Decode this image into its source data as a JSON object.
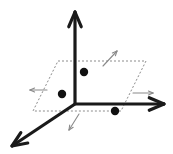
{
  "figure": {
    "type": "diagram",
    "width": 173,
    "height": 154,
    "background_color": "#ffffff"
  },
  "colors": {
    "axis_bold": "#1a1a1a",
    "axis_thin": "#555555",
    "plane_dashed": "#8c8c8c",
    "vector_arrow": "#8a8a8a",
    "point_fill": "#111111"
  },
  "axes": [
    {
      "name": "z-axis",
      "direction": "up",
      "style": "bold-solid-arrow",
      "from": [
        75,
        104
      ],
      "to": [
        75,
        12
      ],
      "stroke_width": 3.2,
      "arrowhead": "open-v"
    },
    {
      "name": "x-axis",
      "direction": "right",
      "style": "bold-solid-arrow",
      "from": [
        75,
        104
      ],
      "to": [
        164,
        104
      ],
      "stroke_width": 3.2,
      "arrowhead": "open-v"
    },
    {
      "name": "y-axis",
      "direction": "down-left",
      "style": "bold-solid-arrow",
      "from": [
        75,
        104
      ],
      "to": [
        12,
        146
      ],
      "stroke_width": 3.2,
      "arrowhead": "open-v"
    }
  ],
  "axis_segments": [
    {
      "name": "z-axis-inner-segment",
      "from": [
        75,
        61
      ],
      "to": [
        75,
        104
      ],
      "stroke_width": 1.6,
      "style": "thin-solid"
    },
    {
      "name": "x-axis-inner-segment",
      "from": [
        75,
        104
      ],
      "to": [
        120,
        104
      ],
      "stroke_width": 1.6,
      "style": "thin-solid"
    },
    {
      "name": "y-axis-inner-segment",
      "from": [
        75,
        104
      ],
      "to": [
        45,
        124
      ],
      "stroke_width": 1.6,
      "style": "thin-solid"
    }
  ],
  "plane": {
    "name": "dashed-parallelogram-plane",
    "style": "dashed",
    "stroke_width": 1.0,
    "dash_pattern": "2,2",
    "corners": [
      [
        58,
        61
      ],
      [
        146,
        61
      ],
      [
        121,
        111
      ],
      [
        33,
        111
      ]
    ]
  },
  "points": [
    {
      "name": "point-upper",
      "cx": 84,
      "cy": 72,
      "r": 4.2
    },
    {
      "name": "point-left",
      "cx": 62,
      "cy": 94,
      "r": 4.2
    },
    {
      "name": "point-lower-right",
      "cx": 115,
      "cy": 111,
      "r": 4.2
    }
  ],
  "vector_arrows": [
    {
      "name": "vector-arrow-up-right",
      "from": [
        103,
        66
      ],
      "to": [
        117,
        51
      ],
      "stroke_width": 1.1,
      "arrowhead": "thin-v"
    },
    {
      "name": "vector-arrow-left",
      "from": [
        47,
        90
      ],
      "to": [
        30,
        90
      ],
      "stroke_width": 1.1,
      "arrowhead": "thin-v"
    },
    {
      "name": "vector-arrow-right",
      "from": [
        133,
        93
      ],
      "to": [
        153,
        93
      ],
      "stroke_width": 1.1,
      "arrowhead": "thin-v"
    },
    {
      "name": "vector-arrow-down-left",
      "from": [
        79,
        114
      ],
      "to": [
        69,
        130
      ],
      "stroke_width": 1.1,
      "arrowhead": "thin-v"
    }
  ]
}
